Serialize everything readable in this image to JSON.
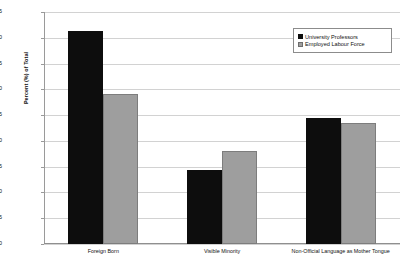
{
  "chart_data": {
    "type": "bar",
    "title": "",
    "xlabel": "",
    "ylabel": "Percent (%) of Total",
    "ylim": [
      0,
      45
    ],
    "ytick_step": 5,
    "yticks": [
      45,
      40,
      35,
      30,
      25,
      20,
      15,
      10,
      5,
      0
    ],
    "grid": true,
    "legend_position": "top-right",
    "categories": [
      "Foreign Born",
      "Visible Minority",
      "Non-Official Language as Mother Tongue"
    ],
    "series": [
      {
        "name": "University Professors",
        "color": "#0d0d0d",
        "values": [
          41.3,
          14.4,
          24.5
        ]
      },
      {
        "name": "Employed Labour Force",
        "color": "#9e9e9e",
        "values": [
          29.1,
          18.0,
          23.5
        ]
      }
    ]
  },
  "legend": {
    "items": [
      {
        "label": "University Professors",
        "swatch": "black-square-swatch"
      },
      {
        "label": "Employed Labour Force",
        "swatch": "gray-square-swatch"
      }
    ]
  }
}
